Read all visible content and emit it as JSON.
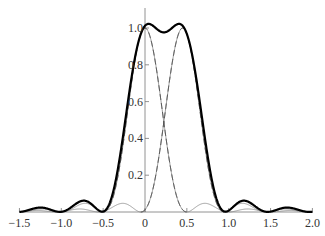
{
  "chart_data": {
    "type": "line",
    "title": "",
    "xlabel": "",
    "ylabel": "",
    "xlim": [
      -1.5,
      2.0
    ],
    "ylim": [
      0,
      1.05
    ],
    "grid": false,
    "legend": null,
    "x_ticks": [
      -1.5,
      -1.0,
      -0.5,
      0,
      0.5,
      1.0,
      1.5,
      2.0
    ],
    "x_tick_labels": [
      "−1.5",
      "−1.0",
      "−0.5",
      "0",
      "0.5",
      "1.0",
      "1.5",
      "2.0"
    ],
    "y_ticks": [
      0.2,
      0.4,
      0.6,
      0.8,
      1.0
    ],
    "y_tick_labels": [
      "0.2",
      "0.4",
      "0.6",
      "0.8",
      "1.0"
    ],
    "series": [
      {
        "name": "sinc^2 centered at 0",
        "style": "dashed",
        "center": 0.0,
        "width_factor": 2.0,
        "points_sample": [
          [
            -0.5,
            0
          ],
          [
            -0.25,
            0.41
          ],
          [
            0,
            1.0
          ],
          [
            0.25,
            0.41
          ],
          [
            0.5,
            0
          ],
          [
            0.75,
            0.045
          ],
          [
            1.0,
            0
          ]
        ]
      },
      {
        "name": "sinc^2 centered at 0.45",
        "style": "dashed",
        "center": 0.45,
        "width_factor": 2.0,
        "points_sample": [
          [
            -0.05,
            0
          ],
          [
            0.2,
            0.41
          ],
          [
            0.45,
            1.0
          ],
          [
            0.7,
            0.41
          ],
          [
            0.95,
            0
          ],
          [
            1.2,
            0.045
          ],
          [
            1.45,
            0
          ]
        ]
      },
      {
        "name": "sum",
        "style": "thick",
        "points_sample": [
          [
            -1.0,
            0.01
          ],
          [
            -0.5,
            0.01
          ],
          [
            -0.25,
            0.45
          ],
          [
            0,
            1.0
          ],
          [
            0.05,
            1.02
          ],
          [
            0.22,
            0.99
          ],
          [
            0.4,
            1.02
          ],
          [
            0.45,
            1.0
          ],
          [
            0.7,
            0.45
          ],
          [
            0.95,
            0.01
          ],
          [
            1.2,
            0.07
          ],
          [
            1.5,
            0.0
          ]
        ]
      }
    ]
  }
}
